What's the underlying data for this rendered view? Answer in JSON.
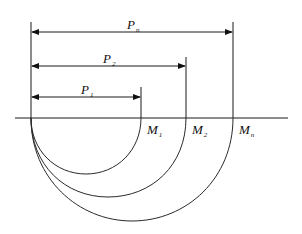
{
  "diagram": {
    "type": "nested semicircles with dimension arrows",
    "baseline": {
      "x1": 15,
      "x2": 288,
      "y": 118
    },
    "origin_x": 31,
    "dimensions": [
      {
        "label": "P",
        "subscript": "n",
        "end_x": 233,
        "arrow_y": 32,
        "top_y": 22
      },
      {
        "label": "P",
        "subscript": "2",
        "end_x": 186,
        "arrow_y": 66,
        "top_y": 57
      },
      {
        "label": "P",
        "subscript": "1",
        "end_x": 141,
        "arrow_y": 97,
        "top_y": 87
      }
    ],
    "points": [
      {
        "label": "M",
        "subscript": "1",
        "x": 141
      },
      {
        "label": "M",
        "subscript": "2",
        "x": 186
      },
      {
        "label": "M",
        "subscript": "n",
        "x": 233
      }
    ],
    "arcs": [
      {
        "name": "arc-1",
        "bottom_y": 174
      },
      {
        "name": "arc-2",
        "bottom_y": 197
      },
      {
        "name": "arc-n",
        "bottom_y": 221
      }
    ]
  },
  "labels": {
    "pn": "P",
    "pn_sub": "n",
    "p2": "P",
    "p2_sub": "2",
    "p1": "P",
    "p1_sub": "1",
    "m1": "M",
    "m1_sub": "1",
    "m2": "M",
    "m2_sub": "2",
    "mn": "M",
    "mn_sub": "n"
  }
}
